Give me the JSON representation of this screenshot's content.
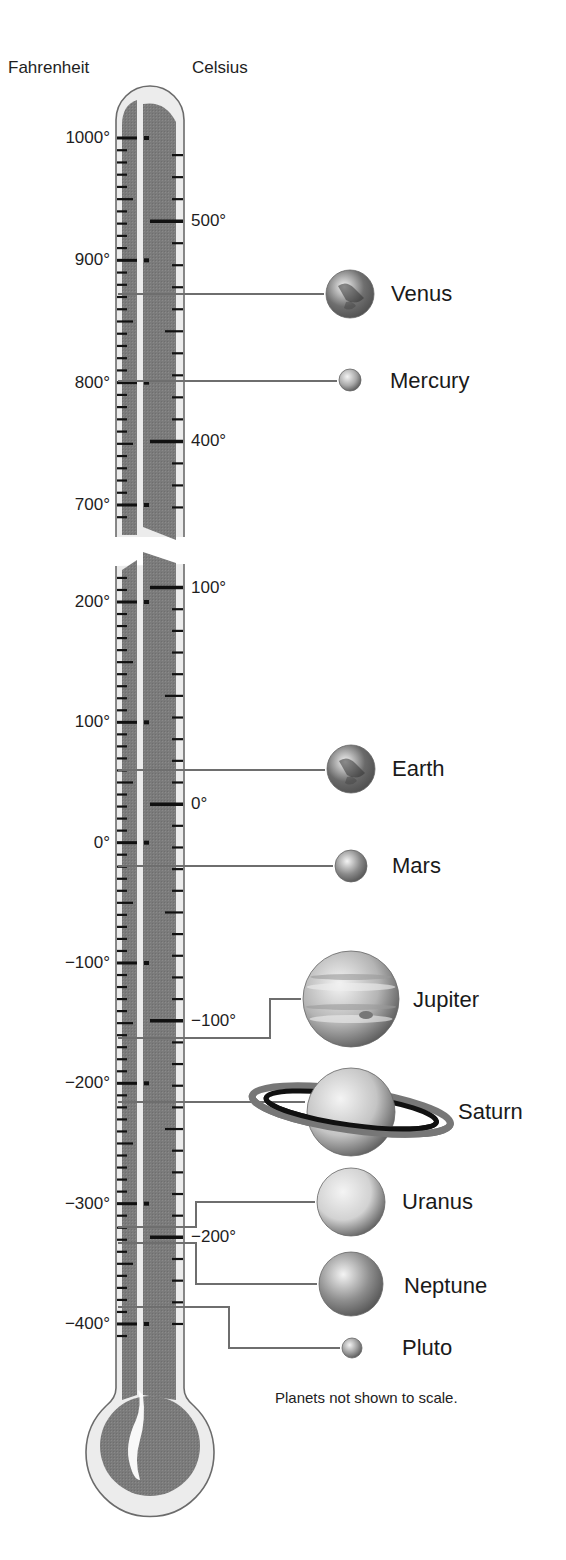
{
  "headers": {
    "fahrenheit": "Fahrenheit",
    "celsius": "Celsius"
  },
  "note": "Planets not shown to scale.",
  "colors": {
    "tube_outline": "#6b6b6b",
    "tube_fill": "#ececec",
    "mercury_column": "#7d7d7d",
    "tick": "#111111",
    "leader_line": "#6e6e6e"
  },
  "scale": {
    "upper": {
      "f_top": 1000,
      "y_top": 138,
      "px_per_f": 1.2233,
      "f_min": 700,
      "f_max": 1000
    },
    "lower": {
      "f_ref": 200,
      "y_ref": 602,
      "px_per_f": 1.2033,
      "f_min": -420,
      "f_max": 230
    }
  },
  "fahrenheit_labels": [
    {
      "text": "1000°",
      "value": 1000,
      "section": "upper"
    },
    {
      "text": "900°",
      "value": 900,
      "section": "upper"
    },
    {
      "text": "800°",
      "value": 800,
      "section": "upper"
    },
    {
      "text": "700°",
      "value": 700,
      "section": "upper"
    },
    {
      "text": "200°",
      "value": 200,
      "section": "lower"
    },
    {
      "text": "100°",
      "value": 100,
      "section": "lower"
    },
    {
      "text": "0°",
      "value": 0,
      "section": "lower"
    },
    {
      "text": "−100°",
      "value": -100,
      "section": "lower"
    },
    {
      "text": "−200°",
      "value": -200,
      "section": "lower"
    },
    {
      "text": "−300°",
      "value": -300,
      "section": "lower"
    },
    {
      "text": "−400°",
      "value": -400,
      "section": "lower"
    }
  ],
  "celsius_labels": [
    {
      "text": "500°",
      "value": 500,
      "section": "upper"
    },
    {
      "text": "400°",
      "value": 400,
      "section": "upper"
    },
    {
      "text": "100°",
      "value": 100,
      "section": "lower"
    },
    {
      "text": "0°",
      "value": 0,
      "section": "lower"
    },
    {
      "text": "−100°",
      "value": -100,
      "section": "lower"
    },
    {
      "text": "−200°",
      "value": -200,
      "section": "lower"
    }
  ],
  "planets": [
    {
      "name": "Venus",
      "temp_f": 872,
      "temp_c": 467,
      "line_y": 294,
      "cx": 350,
      "cy": 294,
      "r": 24,
      "label_x": 391,
      "label_y": 294,
      "color": "#6f6f6f",
      "route": "straight"
    },
    {
      "name": "Mercury",
      "temp_f": 801,
      "temp_c": 427,
      "line_y": 381,
      "cx": 350,
      "cy": 380,
      "r": 11,
      "label_x": 390,
      "label_y": 381,
      "color": "#a8a8a8",
      "route": "straight"
    },
    {
      "name": "Earth",
      "temp_f": 60,
      "temp_c": 15,
      "line_y": 770,
      "cx": 351,
      "cy": 769,
      "r": 24,
      "label_x": 392,
      "label_y": 769,
      "color": "#6a6a6a",
      "route": "straight"
    },
    {
      "name": "Mars",
      "temp_f": -19,
      "temp_c": -28,
      "line_y": 866,
      "cx": 351,
      "cy": 866,
      "r": 16,
      "label_x": 392,
      "label_y": 866,
      "color": "#8a8a8a",
      "route": "straight"
    },
    {
      "name": "Jupiter",
      "temp_f": -162,
      "temp_c": -108,
      "line_y": 1038,
      "cx": 351,
      "cy": 999,
      "r": 48,
      "label_x": 413,
      "label_y": 1000,
      "color": "#b4b4b4",
      "route": "elbow",
      "bend_x": 270
    },
    {
      "name": "Saturn",
      "temp_f": -216,
      "temp_c": -138,
      "line_y": 1102,
      "cx": 351,
      "cy": 1112,
      "r": 44,
      "label_x": 458,
      "label_y": 1112,
      "color": "#c4c4c4",
      "route": "straight",
      "rings": true
    },
    {
      "name": "Uranus",
      "temp_f": -319,
      "temp_c": -195,
      "line_y": 1227,
      "cx": 351,
      "cy": 1202,
      "r": 34,
      "label_x": 402,
      "label_y": 1202,
      "color": "#d2d2d2",
      "route": "elbow",
      "bend_x": 196
    },
    {
      "name": "Neptune",
      "temp_f": -333,
      "temp_c": -203,
      "line_y": 1243,
      "cx": 351,
      "cy": 1284,
      "r": 32,
      "label_x": 404,
      "label_y": 1286,
      "color": "#8e8e8e",
      "route": "elbow",
      "bend_x": 196
    },
    {
      "name": "Pluto",
      "temp_f": -386,
      "temp_c": -232,
      "line_y": 1307,
      "cx": 352,
      "cy": 1348,
      "r": 10,
      "label_x": 402,
      "label_y": 1348,
      "color": "#9a9a9a",
      "route": "elbow",
      "bend_x": 229
    }
  ]
}
